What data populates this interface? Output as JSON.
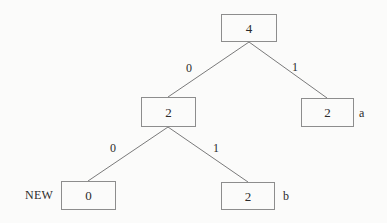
{
  "diagram": {
    "background_color": "#fbfbfa",
    "node_border_color": "#8d8d8d",
    "edge_color": "#7a7a7a",
    "text_color": "#2b2b2b"
  },
  "nodes": [
    {
      "id": "root",
      "value": "4",
      "x": 221,
      "y": 14,
      "width": 56,
      "height": 28,
      "side_label": ""
    },
    {
      "id": "internal-left",
      "value": "2",
      "x": 141,
      "y": 97,
      "width": 55,
      "height": 30,
      "side_label": ""
    },
    {
      "id": "leaf-a",
      "value": "2",
      "x": 301,
      "y": 98,
      "width": 53,
      "height": 29,
      "side_label": "a"
    },
    {
      "id": "leaf-new",
      "value": "0",
      "x": 61,
      "y": 181,
      "width": 55,
      "height": 29,
      "side_label": ""
    },
    {
      "id": "leaf-b",
      "value": "2",
      "x": 221,
      "y": 182,
      "width": 54,
      "height": 28,
      "side_label": "b"
    }
  ],
  "edges": [
    {
      "id": "root-to-internal-left",
      "from": "root",
      "to": "internal-left",
      "label": "0",
      "x1": 249,
      "y1": 42,
      "x2": 168,
      "y2": 97,
      "label_x": 186,
      "label_y": 62
    },
    {
      "id": "root-to-leaf-a",
      "from": "root",
      "to": "leaf-a",
      "label": "1",
      "x1": 249,
      "y1": 42,
      "x2": 327,
      "y2": 98,
      "label_x": 292,
      "label_y": 61
    },
    {
      "id": "internal-left-to-leaf-new",
      "from": "internal-left",
      "to": "leaf-new",
      "label": "0",
      "x1": 168,
      "y1": 127,
      "x2": 88,
      "y2": 181,
      "label_x": 110,
      "label_y": 142
    },
    {
      "id": "internal-left-to-leaf-b",
      "from": "internal-left",
      "to": "leaf-b",
      "label": "1",
      "x1": 168,
      "y1": 127,
      "x2": 248,
      "y2": 182,
      "label_x": 213,
      "label_y": 142
    }
  ],
  "annotations": [
    {
      "id": "new-marker",
      "text": "NEW",
      "x": 25,
      "y": 189
    }
  ],
  "side_labels": [
    {
      "id": "leaf-a-symbol",
      "text": "a",
      "x": 359,
      "y": 107
    },
    {
      "id": "leaf-b-symbol",
      "text": "b",
      "x": 283,
      "y": 190
    }
  ]
}
